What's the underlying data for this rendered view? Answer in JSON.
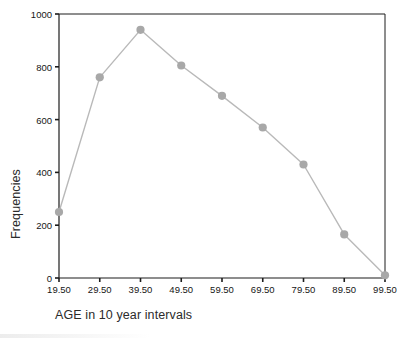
{
  "chart_data": {
    "type": "line",
    "title": "",
    "xlabel": "AGE in 10 year intervals",
    "ylabel": "Frequencies",
    "categories": [
      "19.50",
      "29.50",
      "39.50",
      "49.50",
      "59.50",
      "69.50",
      "79.50",
      "89.50",
      "99.50"
    ],
    "x": [
      19.5,
      29.5,
      39.5,
      49.5,
      59.5,
      69.5,
      79.5,
      89.5,
      99.5
    ],
    "values": [
      250,
      760,
      940,
      805,
      690,
      570,
      430,
      165,
      10
    ],
    "ylim": [
      0,
      1000
    ],
    "yticks": [
      0,
      200,
      400,
      600,
      800,
      1000
    ],
    "ytick_labels": [
      "0",
      "200",
      "400",
      "600",
      "800",
      "1000"
    ],
    "xtick_labels": [
      "19.50",
      "29.50",
      "39.50",
      "49.50",
      "59.50",
      "69.50",
      "79.50",
      "89.50",
      "99.50"
    ],
    "grid": false,
    "legend": false,
    "series": [
      {
        "name": "Frequencies",
        "values": [
          250,
          760,
          940,
          805,
          690,
          570,
          430,
          165,
          10
        ],
        "line_color": "#b9b9b9",
        "marker_color": "#a8a8a8",
        "marker": "circle"
      }
    ],
    "colors": {
      "axis": "#1c1c1c",
      "line": "#b9b9b9",
      "marker": "#a8a8a8",
      "text": "#161616",
      "background": "#ffffff"
    }
  }
}
